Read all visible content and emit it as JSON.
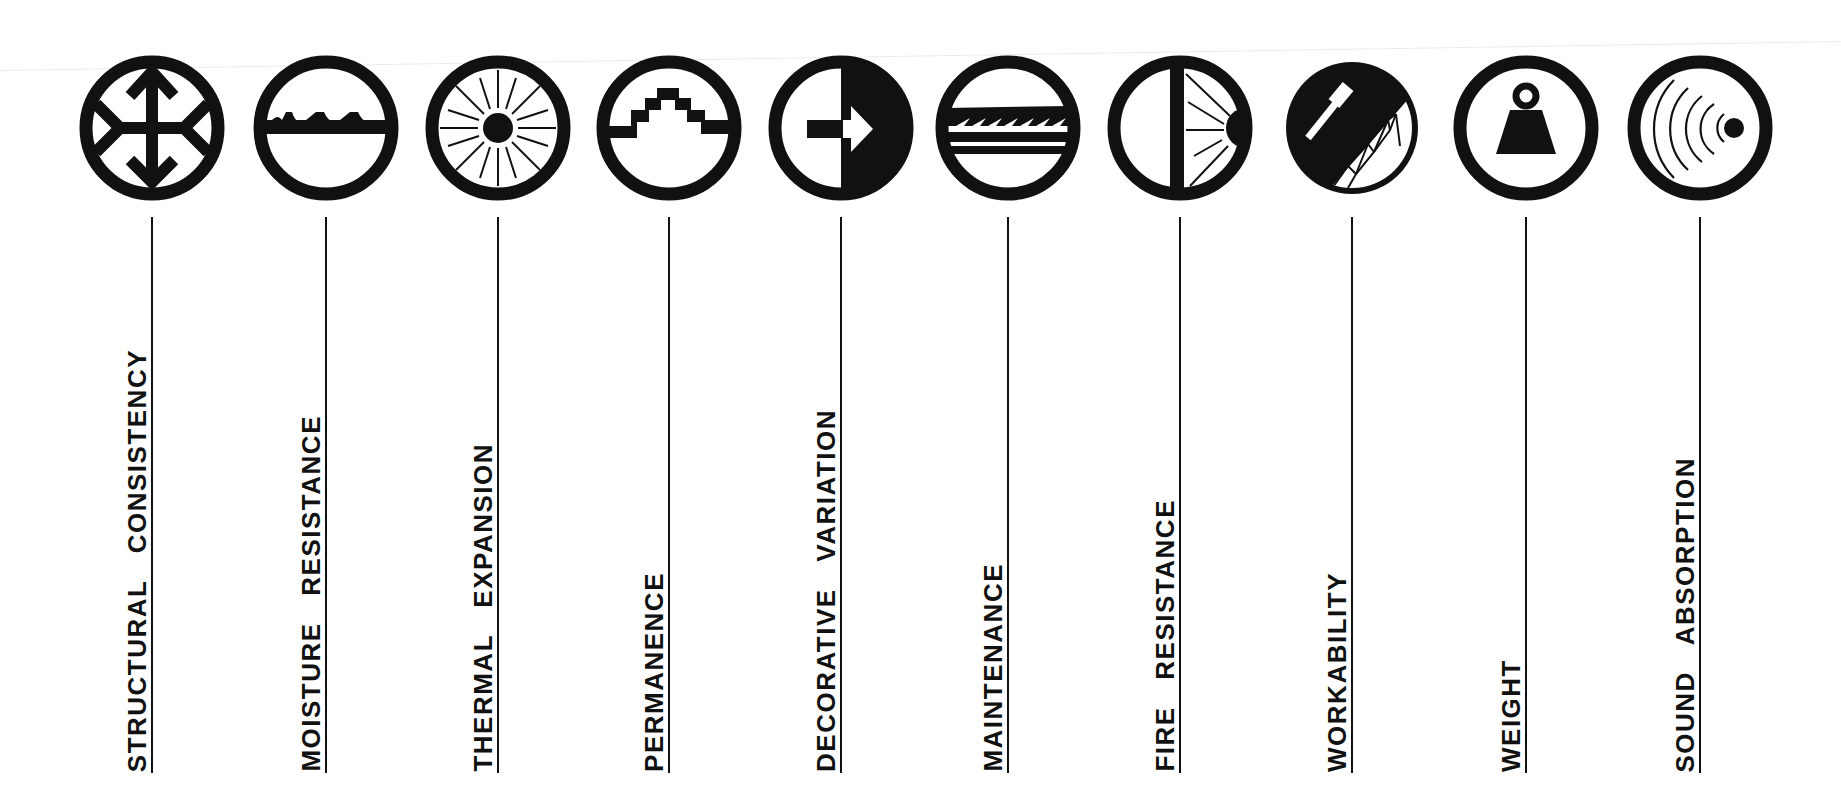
{
  "diagram": {
    "type": "material-properties-legend",
    "colors": {
      "ink": "#111111",
      "paper": "#ffffff"
    },
    "items": [
      {
        "label": "STRUCTURAL CONSISTENCY",
        "icon": "structural-arrows-icon"
      },
      {
        "label": "MOISTURE RESISTANCE",
        "icon": "moisture-waves-icon"
      },
      {
        "label": "THERMAL EXPANSION",
        "icon": "sun-rays-icon"
      },
      {
        "label": "PERMANENCE",
        "icon": "stepped-pyramid-icon"
      },
      {
        "label": "DECORATIVE VARIATION",
        "icon": "half-circle-arrow-icon"
      },
      {
        "label": "MAINTENANCE",
        "icon": "saw-blade-icon"
      },
      {
        "label": "FIRE RESISTANCE",
        "icon": "wall-fire-icon"
      },
      {
        "label": "WORKABILITY",
        "icon": "hammer-truss-icon"
      },
      {
        "label": "WEIGHT",
        "icon": "weight-icon"
      },
      {
        "label": "SOUND ABSORPTION",
        "icon": "sound-waves-icon"
      }
    ]
  }
}
